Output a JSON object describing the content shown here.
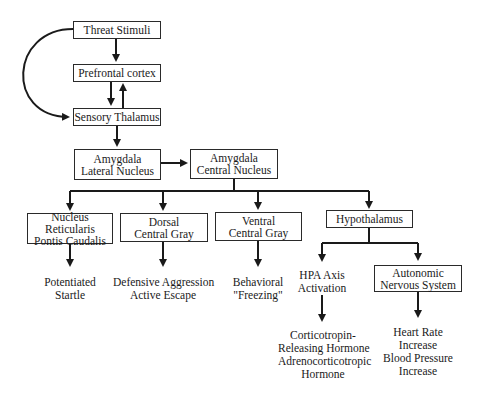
{
  "diagram": {
    "nodes": {
      "threat": {
        "line1": "Threat Stimuli"
      },
      "prefrontal": {
        "line1": "Prefrontal cortex"
      },
      "thalamus": {
        "line1": "Sensory Thalamus"
      },
      "lateral": {
        "line1": "Amygdala",
        "line2": "Lateral Nucleus"
      },
      "central": {
        "line1": "Amygdala",
        "line2": "Central Nucleus"
      },
      "nrpc": {
        "line1": "Nucleus Reticularis",
        "line2": "Pontis Caudalis"
      },
      "dorsal": {
        "line1": "Dorsal",
        "line2": "Central Gray"
      },
      "ventral": {
        "line1": "Ventral",
        "line2": "Central Gray"
      },
      "hypothalamus": {
        "line1": "Hypothalamus"
      },
      "ans": {
        "line1": "Autonomic",
        "line2": "Nervous System"
      }
    },
    "outcomes": {
      "startle": {
        "line1": "Potentiated",
        "line2": "Startle"
      },
      "defensive": {
        "line1": "Defensive Aggression",
        "line2": "Active Escape"
      },
      "freezing": {
        "line1": "Behavioral",
        "line2": "\"Freezing\""
      },
      "hpa": {
        "line1": "HPA Axis",
        "line2": "Activation"
      },
      "hormones": {
        "line1": "Corticotropin-",
        "line2": "Releasing Hormone",
        "line3": "Adrenocorticotropic",
        "line4": "Hormone"
      },
      "cardio": {
        "line1": "Heart Rate",
        "line2": "Increase",
        "line3": "Blood Pressure",
        "line4": "Increase"
      }
    }
  }
}
